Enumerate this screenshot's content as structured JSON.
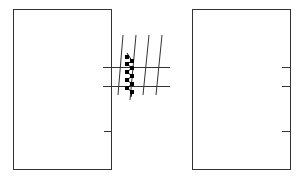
{
  "diagram": {
    "type": "line-drawing",
    "stroke_color": "#333333",
    "fill_color": "#000000",
    "background": "#ffffff",
    "left_panel": {
      "x": 13,
      "y": 9,
      "width": 99,
      "height": 161
    },
    "right_panel": {
      "x": 192,
      "y": 9,
      "width": 99,
      "height": 161
    },
    "connector_lines_y": [
      67,
      86
    ],
    "tick_marks_y": [
      131
    ],
    "hatch_line_count": 4,
    "chain_link_count": 10
  }
}
